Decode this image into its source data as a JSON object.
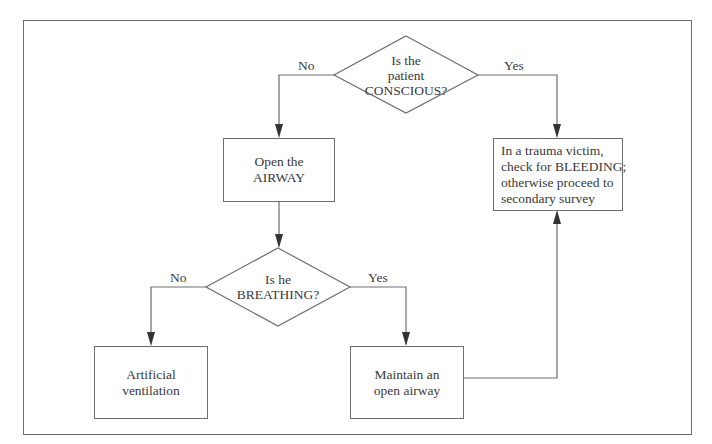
{
  "diagram": {
    "type": "flowchart",
    "decisions": [
      {
        "id": "conscious",
        "lines": [
          "Is the",
          "patient",
          "CONSCIOUS?"
        ],
        "no_label": "No",
        "yes_label": "Yes"
      },
      {
        "id": "breathing",
        "lines": [
          "Is he",
          "BREATHING?"
        ],
        "no_label": "No",
        "yes_label": "Yes"
      }
    ],
    "boxes": [
      {
        "id": "open-airway",
        "lines": [
          "Open the",
          "AIRWAY"
        ]
      },
      {
        "id": "check-bleeding",
        "lines": [
          "In a trauma victim,",
          "check for BLEEDING;",
          "otherwise proceed to",
          "secondary survey"
        ]
      },
      {
        "id": "artificial-ventilation",
        "lines": [
          "Artificial",
          "ventilation"
        ]
      },
      {
        "id": "maintain-airway",
        "lines": [
          "Maintain an",
          "open airway"
        ]
      }
    ],
    "edges": [
      {
        "from": "conscious",
        "to": "open-airway",
        "label": "No"
      },
      {
        "from": "conscious",
        "to": "check-bleeding",
        "label": "Yes"
      },
      {
        "from": "open-airway",
        "to": "breathing",
        "label": ""
      },
      {
        "from": "breathing",
        "to": "artificial-ventilation",
        "label": "No"
      },
      {
        "from": "breathing",
        "to": "maintain-airway",
        "label": "Yes"
      },
      {
        "from": "maintain-airway",
        "to": "check-bleeding",
        "label": ""
      }
    ],
    "colors": {
      "line": "#6e6e6e",
      "text": "#3a3a3a",
      "background": "#ffffff"
    }
  }
}
